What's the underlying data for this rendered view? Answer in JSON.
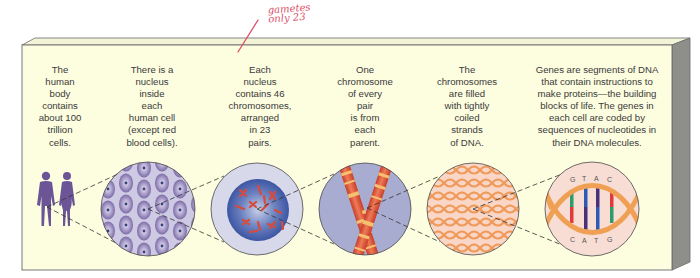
{
  "annotation": {
    "handwritten_note": "gametes\nonly 23",
    "color": "#d9506a"
  },
  "panel": {
    "background": "#fdfde0",
    "border": "#6b6b6b",
    "side_shade": "#8e8e8a",
    "top_shade": "#efefd6"
  },
  "captions": [
    {
      "id": "body",
      "text": "The\nhuman\nbody\ncontains\nabout 100\ntrillion\ncells."
    },
    {
      "id": "cell",
      "text": "There is a\nnucleus\ninside\neach\nhuman cell\n(except red\nblood cells)."
    },
    {
      "id": "nucleus",
      "text": "Each\nnucleus\ncontains 46\nchromosomes,\narranged\nin 23\npairs."
    },
    {
      "id": "chromosome",
      "text": "One\nchromosome\nof every\npair\nis from\neach\nparent."
    },
    {
      "id": "dna-strands",
      "text": "The\nchromosomes\nare filled\nwith tightly\ncoiled\nstrands\nof DNA."
    },
    {
      "id": "genes",
      "text": "Genes are segments of DNA\nthat contain instructions to\nmake proteins—the building\nblocks of life. The genes in\neach cell are coded by\nsequences of nucleotides in\ntheir DNA molecules."
    }
  ],
  "illustrations": [
    {
      "id": "human-figures",
      "icon": "human-couple-icon"
    },
    {
      "id": "cells",
      "icon": "cells-icon"
    },
    {
      "id": "nucleus",
      "icon": "nucleus-icon"
    },
    {
      "id": "chromosome",
      "icon": "chromosome-icon"
    },
    {
      "id": "dna-coils",
      "icon": "dna-coils-icon"
    },
    {
      "id": "dna-helix",
      "icon": "dna-helix-icon"
    }
  ],
  "dna": {
    "top_bases": [
      "G",
      "T",
      "A",
      "C"
    ],
    "bottom_bases": [
      "C",
      "A",
      "T",
      "G"
    ],
    "colors": {
      "G": "#2f9a6a",
      "T": "#2b5bb5",
      "A": "#4a2f7a",
      "C": "#e03a3a",
      "backbone": "#f0a055"
    }
  },
  "colors": {
    "figure_purple": "#6b5596",
    "cell_bg": "#c9c4e0",
    "cell_purple": "#8a7ab0",
    "nucleus_blue": "#3d56a3",
    "nucleus_outer": "#d4d6e8",
    "chromosome_red": "#e0553a",
    "chromosome_band": "#f5c070",
    "chromosome_bg": "#a6abce",
    "coil_bg": "#f9d3c4",
    "coil_orange": "#ef9a5a",
    "helix_bg": "#f7ddd3",
    "dashed_line": "#333333"
  }
}
